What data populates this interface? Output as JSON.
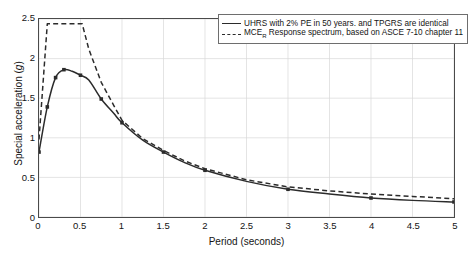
{
  "chart_data": {
    "type": "line",
    "title": "",
    "xlabel": "Period (seconds)",
    "ylabel": "Special acceleration (g)",
    "xlim": [
      0,
      5
    ],
    "ylim": [
      0,
      2.5
    ],
    "xticks": [
      "0",
      "0.5",
      "1",
      "1.5",
      "2",
      "2.5",
      "3",
      "3.5",
      "4",
      "4.5",
      "5"
    ],
    "yticks": [
      "0",
      "0.5",
      "1",
      "1.5",
      "2",
      "2.5"
    ],
    "grid": true,
    "legend_position": "top-right",
    "series": [
      {
        "name": "UHRS with 2% PE in 50 years. and TPGRS are identical",
        "style": "solid",
        "color": "#2b2b2b",
        "marker": "square",
        "x": [
          0,
          0.1,
          0.2,
          0.3,
          0.4,
          0.5,
          0.6,
          0.75,
          0.9,
          1.0,
          1.25,
          1.5,
          1.75,
          2.0,
          2.5,
          3.0,
          3.5,
          4.0,
          4.5,
          5.0
        ],
        "y": [
          0.82,
          1.39,
          1.76,
          1.86,
          1.84,
          1.79,
          1.73,
          1.49,
          1.31,
          1.19,
          0.97,
          0.82,
          0.69,
          0.59,
          0.45,
          0.35,
          0.29,
          0.24,
          0.21,
          0.19
        ],
        "marker_x": [
          0,
          0.1,
          0.2,
          0.3,
          0.5,
          0.75,
          1.0,
          1.5,
          2.0,
          3.0,
          4.0,
          5.0
        ],
        "marker_y": [
          0.82,
          1.39,
          1.76,
          1.86,
          1.79,
          1.49,
          1.19,
          0.82,
          0.59,
          0.35,
          0.24,
          0.19
        ]
      },
      {
        "name": "MCE_R Response spectrum, based on ASCE 7-10 chapter 11",
        "name_base": "MCE",
        "name_sub": "R",
        "name_rest": " Response spectrum, based on ASCE 7-10 chapter 11",
        "style": "dashed",
        "color": "#2b2b2b",
        "marker": "none",
        "x": [
          0,
          0.1,
          0.52,
          0.6,
          0.75,
          0.9,
          1.0,
          1.25,
          1.5,
          1.75,
          2.0,
          2.5,
          3.0,
          3.5,
          4.0,
          4.5,
          5.0
        ],
        "y": [
          0.98,
          2.44,
          2.44,
          2.12,
          1.7,
          1.41,
          1.22,
          0.99,
          0.84,
          0.71,
          0.61,
          0.47,
          0.38,
          0.33,
          0.29,
          0.26,
          0.23
        ]
      }
    ]
  },
  "legend": {
    "entries": [
      {
        "label": "UHRS with 2% PE in 50 years. and TPGRS are identical"
      },
      {
        "label_base": "MCE",
        "label_sub": "R",
        "label_rest": " Response spectrum, based on ASCE 7-10 chapter 11"
      }
    ]
  }
}
